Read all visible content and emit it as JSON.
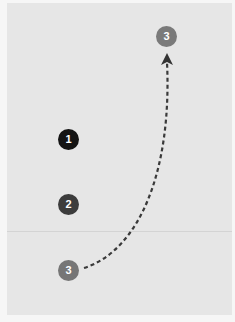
{
  "diagram": {
    "tokens": [
      {
        "id": "token-1",
        "label": "1",
        "color": "#141414"
      },
      {
        "id": "token-2",
        "label": "2",
        "color": "#3c3c3c"
      },
      {
        "id": "token-3-start",
        "label": "3",
        "color": "#767676"
      },
      {
        "id": "token-3-end",
        "label": "3",
        "color": "#7a7a7a"
      }
    ],
    "arrow": {
      "style": "dashed",
      "color": "#3a3a3a",
      "from": "token-3-start",
      "to": "token-3-end"
    }
  }
}
